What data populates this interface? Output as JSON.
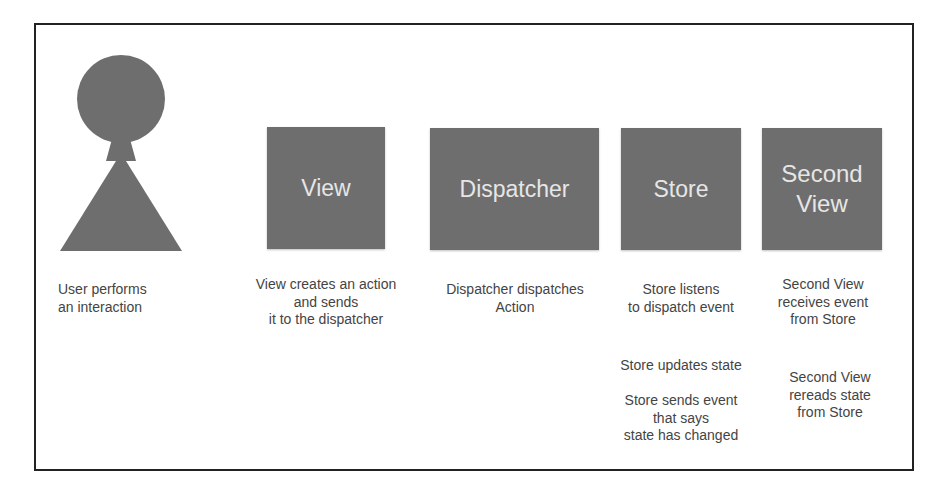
{
  "diagram": {
    "colors": {
      "box_fill": "#6e6e6e",
      "box_text": "#e6e6e6",
      "caption_text": "#444444",
      "border": "#222222",
      "background": "#ffffff"
    },
    "actor": {
      "name": "User",
      "icon": "user-figure-icon",
      "caption": [
        "User performs",
        "an interaction"
      ]
    },
    "nodes": [
      {
        "id": "view",
        "label_lines": [
          "View"
        ],
        "caption": [
          "View creates an action",
          "and sends",
          "it to the dispatcher"
        ]
      },
      {
        "id": "dispatcher",
        "label_lines": [
          "Dispatcher"
        ],
        "caption": [
          "Dispatcher dispatches",
          "Action"
        ]
      },
      {
        "id": "store",
        "label_lines": [
          "Store"
        ],
        "caption": [
          "Store listens",
          "to dispatch event"
        ],
        "extra_captions": [
          [
            "Store updates state"
          ],
          [
            "Store sends event",
            "that says",
            "state has changed"
          ]
        ]
      },
      {
        "id": "second-view",
        "label_lines": [
          "Second",
          "View"
        ],
        "caption": [
          "Second View",
          "receives event",
          "from Store"
        ],
        "extra_captions": [
          [
            "Second View",
            "rereads state",
            "from Store"
          ]
        ]
      }
    ]
  }
}
